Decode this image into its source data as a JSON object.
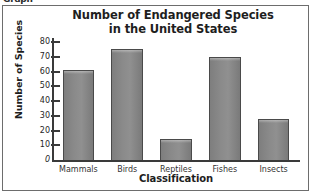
{
  "header": {
    "label": "Graph"
  },
  "chart_data": {
    "type": "bar",
    "title": "Number of Endangered Species in the United States",
    "title_lines": [
      "Number of Endangered Species",
      "in the United States"
    ],
    "xlabel": "Classification",
    "ylabel": "Number of Species",
    "categories": [
      "Mammals",
      "Birds",
      "Reptiles",
      "Fishes",
      "Insects"
    ],
    "values": [
      61,
      75,
      14,
      70,
      28
    ],
    "ylim": [
      0,
      80
    ],
    "ytick_step": 10,
    "yticks": [
      80,
      70,
      60,
      50,
      40,
      30,
      20,
      10,
      0
    ],
    "grid": false,
    "legend": false,
    "bar_color": "#888888",
    "bar_border_color": "#4a4a4a",
    "axis_color": "#3a3a3a",
    "frame_color": "#6d6d6d"
  }
}
